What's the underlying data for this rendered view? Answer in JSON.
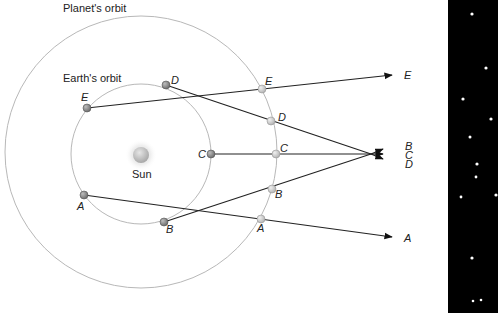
{
  "labels": {
    "planet_orbit": "Planet's orbit",
    "earth_orbit": "Earth's orbit",
    "sun": "Sun"
  },
  "earth_positions": [
    {
      "id": "A",
      "label": "A"
    },
    {
      "id": "B",
      "label": "B"
    },
    {
      "id": "C",
      "label": "C"
    },
    {
      "id": "D",
      "label": "D"
    },
    {
      "id": "E",
      "label": "E"
    }
  ],
  "planet_positions": [
    {
      "id": "A",
      "label": "A"
    },
    {
      "id": "B",
      "label": "B"
    },
    {
      "id": "C",
      "label": "C"
    },
    {
      "id": "D",
      "label": "D"
    },
    {
      "id": "E",
      "label": "E"
    }
  ],
  "sky_directions": [
    {
      "id": "E",
      "label": "E"
    },
    {
      "id": "B",
      "label": "B"
    },
    {
      "id": "C",
      "label": "C"
    },
    {
      "id": "D",
      "label": "D"
    },
    {
      "id": "A",
      "label": "A"
    }
  ],
  "colors": {
    "orbit": "#b8b8b8",
    "sightline": "#222222",
    "sky_background": "#000000",
    "star": "#ffffff",
    "earth_dot": "#8a8a8a",
    "planet_dot": "#cfcfcf",
    "sun": "#c4c4c4"
  }
}
